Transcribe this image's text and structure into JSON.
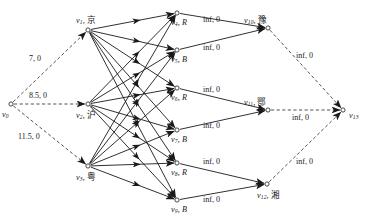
{
  "figure": {
    "type": "network-flow-graph",
    "background": "#ffffff",
    "ink": "#1a1a1a",
    "width": 378,
    "height": 224
  },
  "nodes": [
    {
      "id": "v0",
      "index": "0",
      "name": "v",
      "region": "",
      "cap": "",
      "x": 11,
      "y": 104,
      "label_dx": -9,
      "label_dy": 7,
      "align": "left"
    },
    {
      "id": "v1",
      "index": "1",
      "name": "v",
      "region": "京",
      "cap": "",
      "x": 88,
      "y": 30,
      "label_dx": -12,
      "label_dy": -14,
      "align": "left"
    },
    {
      "id": "v2",
      "index": "2",
      "name": "v",
      "region": "沪",
      "cap": "",
      "x": 88,
      "y": 104,
      "label_dx": -12,
      "label_dy": 7,
      "align": "left"
    },
    {
      "id": "v3",
      "index": "3",
      "name": "v",
      "region": "粤",
      "cap": "",
      "x": 88,
      "y": 166,
      "label_dx": -12,
      "label_dy": 7,
      "align": "left"
    },
    {
      "id": "v4",
      "index": "4",
      "name": "v",
      "region": "",
      "cap": "R",
      "x": 177,
      "y": 13,
      "label_dx": -6,
      "label_dy": 6,
      "align": "left"
    },
    {
      "id": "v5",
      "index": "5",
      "name": "v",
      "region": "",
      "cap": "B",
      "x": 177,
      "y": 50,
      "label_dx": -6,
      "label_dy": 6,
      "align": "left"
    },
    {
      "id": "v6",
      "index": "6",
      "name": "v",
      "region": "",
      "cap": "R",
      "x": 177,
      "y": 88,
      "label_dx": -6,
      "label_dy": 6,
      "align": "left"
    },
    {
      "id": "v7",
      "index": "7",
      "name": "v",
      "region": "",
      "cap": "B",
      "x": 177,
      "y": 130,
      "label_dx": -6,
      "label_dy": 6,
      "align": "left"
    },
    {
      "id": "v8",
      "index": "8",
      "name": "v",
      "region": "",
      "cap": "R",
      "x": 177,
      "y": 163,
      "label_dx": -6,
      "label_dy": 6,
      "align": "left"
    },
    {
      "id": "v9",
      "index": "9",
      "name": "v",
      "region": "",
      "cap": "B",
      "x": 177,
      "y": 200,
      "label_dx": -6,
      "label_dy": 6,
      "align": "left"
    },
    {
      "id": "v10",
      "index": "10",
      "name": "v",
      "region": "豫",
      "cap": "",
      "x": 268,
      "y": 28,
      "label_dx": -24,
      "label_dy": -12,
      "align": "left"
    },
    {
      "id": "v11",
      "index": "11",
      "name": "v",
      "region": "鄂",
      "cap": "",
      "x": 268,
      "y": 110,
      "label_dx": -24,
      "label_dy": -12,
      "align": "left"
    },
    {
      "id": "v12",
      "index": "12",
      "name": "v",
      "region": "湘",
      "cap": "",
      "x": 267,
      "y": 184,
      "label_dx": -10,
      "label_dy": 7,
      "align": "left"
    },
    {
      "id": "v13",
      "index": "13",
      "name": "v",
      "region": "",
      "cap": "",
      "x": 343,
      "y": 110,
      "label_dx": 6,
      "label_dy": 2,
      "align": "left"
    }
  ],
  "edges": [
    {
      "from": "v0",
      "to": "v1",
      "style": "dashed",
      "label": "7, 0",
      "lx": 29,
      "ly": 55
    },
    {
      "from": "v0",
      "to": "v2",
      "style": "dashed",
      "label": "8.5, 0",
      "lx": 29,
      "ly": 92
    },
    {
      "from": "v0",
      "to": "v3",
      "style": "dashed",
      "label": "11.5, 0",
      "lx": 18,
      "ly": 133
    },
    {
      "from": "v1",
      "to": "v4",
      "style": "solid",
      "label": ""
    },
    {
      "from": "v1",
      "to": "v5",
      "style": "solid",
      "label": ""
    },
    {
      "from": "v1",
      "to": "v6",
      "style": "solid",
      "label": ""
    },
    {
      "from": "v1",
      "to": "v7",
      "style": "solid",
      "label": ""
    },
    {
      "from": "v1",
      "to": "v8",
      "style": "solid",
      "label": ""
    },
    {
      "from": "v1",
      "to": "v9",
      "style": "solid",
      "label": ""
    },
    {
      "from": "v2",
      "to": "v4",
      "style": "solid",
      "label": ""
    },
    {
      "from": "v2",
      "to": "v5",
      "style": "solid",
      "label": ""
    },
    {
      "from": "v2",
      "to": "v6",
      "style": "solid",
      "label": ""
    },
    {
      "from": "v2",
      "to": "v7",
      "style": "solid",
      "label": ""
    },
    {
      "from": "v2",
      "to": "v8",
      "style": "solid",
      "label": ""
    },
    {
      "from": "v2",
      "to": "v9",
      "style": "solid",
      "label": ""
    },
    {
      "from": "v3",
      "to": "v4",
      "style": "solid",
      "label": ""
    },
    {
      "from": "v3",
      "to": "v5",
      "style": "solid",
      "label": ""
    },
    {
      "from": "v3",
      "to": "v6",
      "style": "solid",
      "label": ""
    },
    {
      "from": "v3",
      "to": "v7",
      "style": "solid",
      "label": ""
    },
    {
      "from": "v3",
      "to": "v8",
      "style": "solid",
      "label": ""
    },
    {
      "from": "v3",
      "to": "v9",
      "style": "solid",
      "label": ""
    },
    {
      "from": "v4",
      "to": "v10",
      "style": "solid",
      "label": "inf, 0",
      "lx": 203,
      "ly": 16
    },
    {
      "from": "v5",
      "to": "v10",
      "style": "solid",
      "label": "inf, 0",
      "lx": 203,
      "ly": 44
    },
    {
      "from": "v6",
      "to": "v11",
      "style": "solid",
      "label": "inf, 0",
      "lx": 203,
      "ly": 86
    },
    {
      "from": "v7",
      "to": "v11",
      "style": "solid",
      "label": "inf, 0",
      "lx": 203,
      "ly": 122
    },
    {
      "from": "v8",
      "to": "v12",
      "style": "solid",
      "label": "inf, 0",
      "lx": 203,
      "ly": 158
    },
    {
      "from": "v9",
      "to": "v12",
      "style": "solid",
      "label": "inf, 0",
      "lx": 203,
      "ly": 196
    },
    {
      "from": "v10",
      "to": "v13",
      "style": "dashed",
      "label": "inf, 0",
      "lx": 296,
      "ly": 52
    },
    {
      "from": "v11",
      "to": "v13",
      "style": "dashed",
      "label": "inf, 0",
      "lx": 292,
      "ly": 114
    },
    {
      "from": "v12",
      "to": "v13",
      "style": "dashed",
      "label": "inf, 0",
      "lx": 296,
      "ly": 158
    }
  ]
}
